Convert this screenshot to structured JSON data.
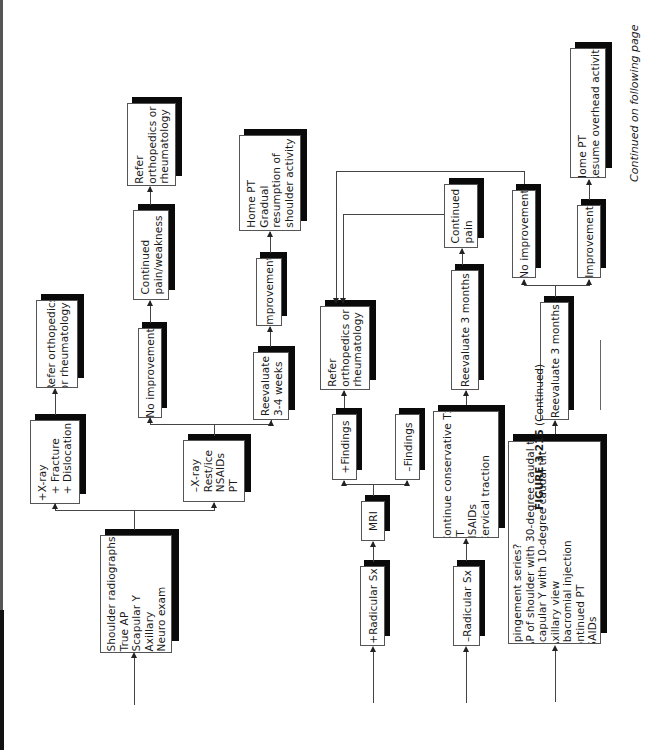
{
  "figure": {
    "label": "FIGURE 3-215",
    "suffix": "(Continued)",
    "continued_note": "Continued on following page"
  },
  "nodes": {
    "shoulder_radiographs": "Shoulder radiographs\nTrue AP\nScapular Y\nAxillary\nNeuro exam",
    "pos_xray": "+X-ray\n  + Fracture\n  + Dislocation",
    "refer_1": "Refer orthopedics\nor rheumatology",
    "neg_xray": "–X-ray\nRest/ice\nNSAIDs\nPT",
    "no_improvement_1": "No improvement",
    "continued_pain_weakness": "Continued\npain/weakness",
    "refer_2": "Refer\northopedics or\nrheumatology",
    "reevaluate_3_4_weeks": "Reevaluate\n3-4 weeks",
    "improvement_1": "Improvement",
    "home_pt_gradual": "Home PT\nGradual\nresumption of\nshoulder activity",
    "pos_radicular": "+Radicular Sx",
    "mri": "MRI",
    "pos_findings": "+Findings",
    "neg_findings": "–Findings",
    "refer_3": "Refer\northopedics or\nrheumatology",
    "neg_radicular": "–Radicular Sx",
    "continue_conservative": "Continue conservative Tx\nPT\nNSAIDs\nCervical traction",
    "reevaluate_3_months_1": "Reevaluate 3 months",
    "continued_pain": "Continued\npain",
    "impingement": "Impingement series?\n· AP of shoulder with 30-degree caudal tilt\n· Scapular Y with 10-degree caudal tilt\n· Axillary view\nSubacromial injection\nContinued PT\nNSAIDs",
    "reevaluate_3_months_2": "Reevaluate 3 months",
    "no_improvement_2": "No improvement",
    "improvement_2": "Improvement",
    "home_pt_resume": "Home PT\nResume overhead activity"
  },
  "colors": {
    "shadow": "#0a0a0a",
    "border": "#555555",
    "line": "#444444"
  }
}
